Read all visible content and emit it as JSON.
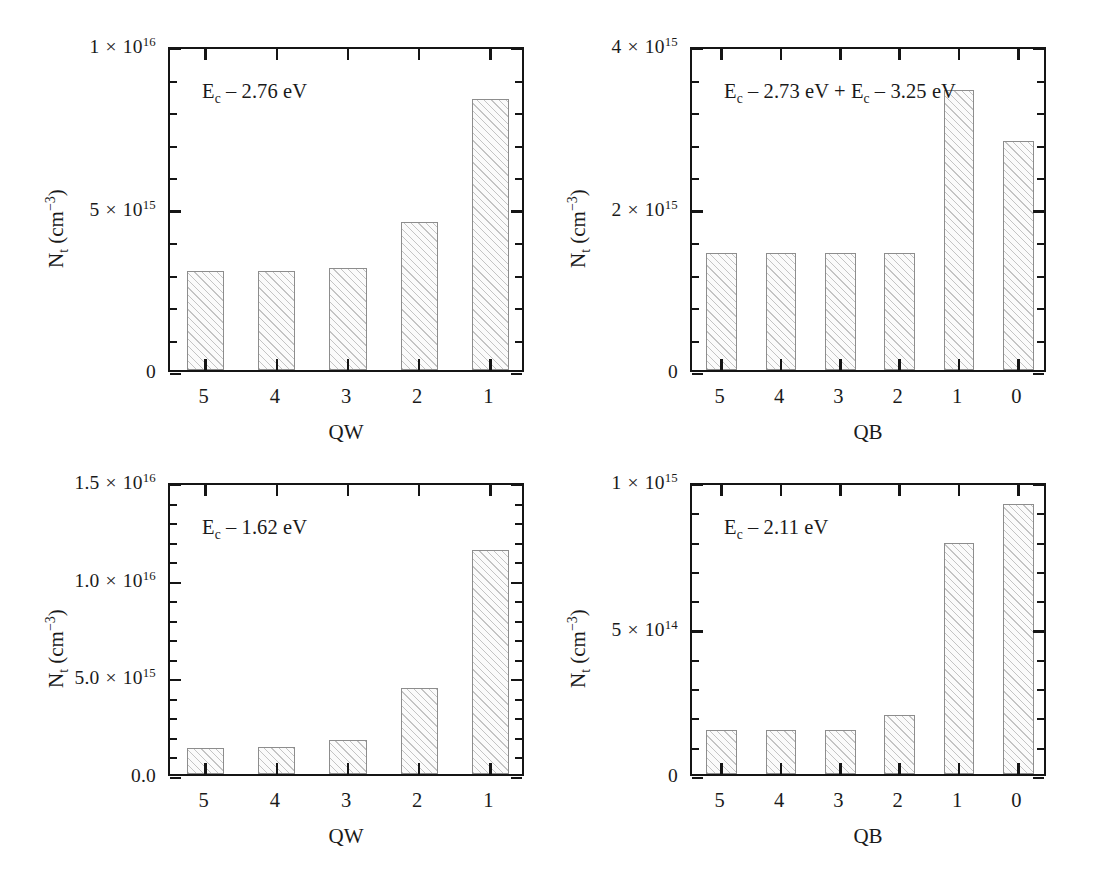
{
  "figure": {
    "background": "#ffffff",
    "bar_edge_color": "#8d8d8d",
    "axis_color": "#151515"
  },
  "chart_data": [
    {
      "type": "bar",
      "panel": "top-left",
      "title": "",
      "annotation": "E_c – 2.76 eV",
      "annotation_parts": {
        "base": "E",
        "sub": "c",
        "rest": " – 2.76 eV"
      },
      "xlabel": "QW",
      "ylabel": "N_t (cm^-3)",
      "ylabel_parts": {
        "base": "N",
        "sub": "t",
        "unit_base": " (cm",
        "unit_sup": "−3",
        "unit_close": ")"
      },
      "categories": [
        "5",
        "4",
        "3",
        "2",
        "1"
      ],
      "values": [
        3050000000000000.0,
        3050000000000000.0,
        3150000000000000.0,
        4550000000000000.0,
        8350000000000000.0
      ],
      "ylim": [
        0,
        1e+16
      ],
      "ytick_values": [
        0,
        5000000000000000.0,
        1e+16
      ],
      "ytick_labels": [
        "0",
        "5 × 10^15",
        "1 × 10^16"
      ],
      "ytick_label_parts": [
        {
          "mantissa": "0",
          "has_exp": false
        },
        {
          "mantissa": "5",
          "times": "×",
          "base": "10",
          "exp": "15",
          "has_exp": true
        },
        {
          "mantissa": "1",
          "times": "×",
          "base": "10",
          "exp": "16",
          "has_exp": true
        }
      ],
      "y_minor_per_major": 5,
      "grid": false,
      "legend": "none"
    },
    {
      "type": "bar",
      "panel": "top-right",
      "title": "",
      "annotation": "E_c – 2.73 eV + E_c – 3.25 eV",
      "annotation_parts": {
        "base": "E",
        "sub": "c",
        "rest": " – 2.73 eV + ",
        "base2": "E",
        "sub2": "c",
        "rest2": " – 3.25 eV"
      },
      "xlabel": "QB",
      "ylabel": "N_t (cm^-3)",
      "ylabel_parts": {
        "base": "N",
        "sub": "t",
        "unit_base": " (cm",
        "unit_sup": "−3",
        "unit_close": ")"
      },
      "categories": [
        "5",
        "4",
        "3",
        "2",
        "1",
        "0"
      ],
      "values": [
        1440000000000000.0,
        1440000000000000.0,
        1440000000000000.0,
        1440000000000000.0,
        3450000000000000.0,
        2820000000000000.0
      ],
      "ylim": [
        0,
        4000000000000000.0
      ],
      "ytick_values": [
        0,
        2000000000000000.0,
        4000000000000000.0
      ],
      "ytick_labels": [
        "0",
        "2 × 10^15",
        "4 × 10^15"
      ],
      "ytick_label_parts": [
        {
          "mantissa": "0",
          "has_exp": false
        },
        {
          "mantissa": "2",
          "times": "×",
          "base": "10",
          "exp": "15",
          "has_exp": true
        },
        {
          "mantissa": "4",
          "times": "×",
          "base": "10",
          "exp": "15",
          "has_exp": true
        }
      ],
      "y_minor_per_major": 5,
      "grid": false,
      "legend": "none"
    },
    {
      "type": "bar",
      "panel": "bottom-left",
      "title": "",
      "annotation": "E_c – 1.62 eV",
      "annotation_parts": {
        "base": "E",
        "sub": "c",
        "rest": " – 1.62 eV"
      },
      "xlabel": "QW",
      "ylabel": "N_t (cm^-3)",
      "ylabel_parts": {
        "base": "N",
        "sub": "t",
        "unit_base": " (cm",
        "unit_sup": "−3",
        "unit_close": ")"
      },
      "categories": [
        "5",
        "4",
        "3",
        "2",
        "1"
      ],
      "values": [
        1350000000000000.0,
        1380000000000000.0,
        1750000000000000.0,
        4400000000000000.0,
        1.145e+16
      ],
      "ylim": [
        0,
        1.5e+16
      ],
      "ytick_values": [
        0,
        5000000000000000.0,
        1e+16,
        1.5e+16
      ],
      "ytick_labels": [
        "0.0",
        "5.0 × 10^15",
        "1.0 × 10^16",
        "1.5 × 10^16"
      ],
      "ytick_label_parts": [
        {
          "mantissa": "0.0",
          "has_exp": false
        },
        {
          "mantissa": "5.0",
          "times": "×",
          "base": "10",
          "exp": "15",
          "has_exp": true
        },
        {
          "mantissa": "1.0",
          "times": "×",
          "base": "10",
          "exp": "16",
          "has_exp": true
        },
        {
          "mantissa": "1.5",
          "times": "×",
          "base": "10",
          "exp": "16",
          "has_exp": true
        }
      ],
      "y_minor_per_major": 5,
      "grid": false,
      "legend": "none"
    },
    {
      "type": "bar",
      "panel": "bottom-right",
      "title": "",
      "annotation": "E_c – 2.11 eV",
      "annotation_parts": {
        "base": "E",
        "sub": "c",
        "rest": " – 2.11 eV"
      },
      "xlabel": "QB",
      "ylabel": "N_t (cm^-3)",
      "ylabel_parts": {
        "base": "N",
        "sub": "t",
        "unit_base": " (cm",
        "unit_sup": "−3",
        "unit_close": ")"
      },
      "categories": [
        "5",
        "4",
        "3",
        "2",
        "1",
        "0"
      ],
      "values": [
        150000000000000.0,
        150000000000000.0,
        150000000000000.0,
        200000000000000.0,
        790000000000000.0,
        920000000000000.0
      ],
      "ylim": [
        0,
        1000000000000000.0
      ],
      "ytick_values": [
        0,
        500000000000000.0,
        1000000000000000.0
      ],
      "ytick_labels": [
        "0",
        "5 × 10^14",
        "1 × 10^15"
      ],
      "ytick_label_parts": [
        {
          "mantissa": "0",
          "has_exp": false
        },
        {
          "mantissa": "5",
          "times": "×",
          "base": "10",
          "exp": "14",
          "has_exp": true
        },
        {
          "mantissa": "1",
          "times": "×",
          "base": "10",
          "exp": "15",
          "has_exp": true
        }
      ],
      "y_minor_per_major": 5,
      "grid": false,
      "legend": "none"
    }
  ]
}
